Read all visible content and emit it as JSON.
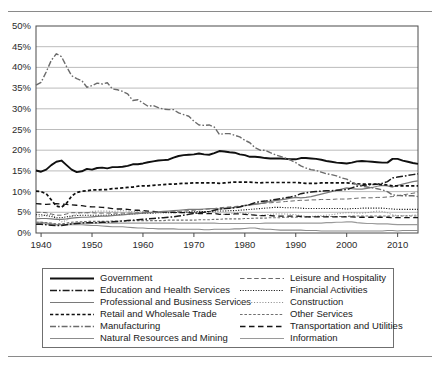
{
  "figure": {
    "top_rule": "horizontal-rule",
    "bottom_rule": "horizontal-rule"
  },
  "axes": {
    "y_ticks": [
      "0%",
      "5%",
      "10%",
      "15%",
      "20%",
      "25%",
      "30%",
      "35%",
      "40%",
      "45%",
      "50%"
    ],
    "x_ticks": [
      "1940",
      "1950",
      "1960",
      "1970",
      "1980",
      "1990",
      "2000",
      "2010"
    ]
  },
  "legend": {
    "left_column": [
      {
        "label": "Government",
        "style": "solid-thick-black"
      },
      {
        "label": "Education and Health Services",
        "style": "dash-dot-black"
      },
      {
        "label": "Professional and Business Services",
        "style": "solid-gray"
      },
      {
        "label": "Retail and Wholesale Trade",
        "style": "dashed-bold-black"
      },
      {
        "label": "Manufacturing",
        "style": "dash-dot-gray"
      },
      {
        "label": "Natural Resources and Mining",
        "style": "solid-midgray"
      }
    ],
    "right_column": [
      {
        "label": "Leisure and Hospitality",
        "style": "dashed-thin-gray"
      },
      {
        "label": "Financial Activities",
        "style": "dotted-fine-black"
      },
      {
        "label": "Construction",
        "style": "dotted-fine-gray"
      },
      {
        "label": "Other Services",
        "style": "dashed-small-gray"
      },
      {
        "label": "Transportation and Utilities",
        "style": "long-dash-black"
      },
      {
        "label": "Information",
        "style": "solid-lightgray"
      }
    ]
  },
  "colors": {
    "plot_border": "#4a4a4a",
    "gridline": "#b4b4b4",
    "government": "#101010",
    "education": "#1c1c1c",
    "professional": "#7a7a7a",
    "retail": "#0f0f0f",
    "manufacturing": "#6b6b6b",
    "natural_resources": "#8c8c8c",
    "leisure": "#6a6a6a",
    "financial": "#161616",
    "construction": "#8f8f8f",
    "other_services": "#707070",
    "transportation": "#141414",
    "information": "#9a9a9a"
  },
  "chart_data": {
    "type": "line",
    "title": "",
    "xlabel": "",
    "ylabel": "",
    "xlim": [
      1939,
      2014
    ],
    "ylim": [
      0,
      50
    ],
    "grid": true,
    "legend_position": "below-plot-two-columns",
    "x": [
      1939,
      1940,
      1941,
      1942,
      1943,
      1944,
      1945,
      1946,
      1947,
      1948,
      1949,
      1950,
      1951,
      1952,
      1953,
      1954,
      1955,
      1956,
      1957,
      1958,
      1959,
      1960,
      1961,
      1962,
      1963,
      1964,
      1965,
      1966,
      1967,
      1968,
      1969,
      1970,
      1971,
      1972,
      1973,
      1974,
      1975,
      1976,
      1977,
      1978,
      1979,
      1980,
      1981,
      1982,
      1983,
      1984,
      1985,
      1986,
      1987,
      1988,
      1989,
      1990,
      1991,
      1992,
      1993,
      1994,
      1995,
      1996,
      1997,
      1998,
      1999,
      2000,
      2001,
      2002,
      2003,
      2004,
      2005,
      2006,
      2007,
      2008,
      2009,
      2010,
      2011,
      2012,
      2013,
      2014
    ],
    "series": [
      {
        "name": "Manufacturing",
        "style": "dash-dot-gray",
        "values": [
          35.7,
          36.4,
          38.9,
          41.7,
          43.3,
          42.6,
          40.2,
          38.0,
          37.3,
          36.8,
          35.2,
          35.6,
          36.2,
          36.0,
          36.3,
          34.8,
          34.6,
          34.2,
          33.6,
          32.0,
          32.2,
          31.4,
          30.6,
          30.8,
          30.3,
          29.9,
          29.8,
          29.8,
          29.0,
          28.6,
          28.2,
          27.0,
          26.1,
          26.0,
          26.1,
          25.6,
          23.8,
          24.0,
          24.0,
          23.6,
          23.2,
          22.4,
          21.8,
          20.6,
          20.0,
          20.0,
          19.4,
          18.9,
          18.5,
          18.1,
          17.6,
          17.0,
          16.2,
          15.7,
          15.3,
          15.1,
          14.7,
          14.3,
          14.1,
          13.8,
          13.3,
          13.0,
          12.3,
          11.7,
          11.3,
          11.1,
          10.9,
          10.7,
          10.4,
          10.0,
          9.2,
          9.1,
          9.0,
          9.0,
          9.0,
          8.8
        ]
      },
      {
        "name": "Government",
        "style": "solid-thick-black",
        "values": [
          15.1,
          14.8,
          15.3,
          16.4,
          17.2,
          17.5,
          16.4,
          15.3,
          14.7,
          14.9,
          15.5,
          15.3,
          15.7,
          15.8,
          15.6,
          15.9,
          15.9,
          16.0,
          16.2,
          16.6,
          16.6,
          16.8,
          17.1,
          17.3,
          17.5,
          17.6,
          17.7,
          18.2,
          18.6,
          18.8,
          18.9,
          19.0,
          19.2,
          19.0,
          18.9,
          19.3,
          19.8,
          19.7,
          19.5,
          19.4,
          19.0,
          18.8,
          18.4,
          18.4,
          18.3,
          18.1,
          18.0,
          18.0,
          18.0,
          17.9,
          17.8,
          17.8,
          18.1,
          18.1,
          18.0,
          17.9,
          17.7,
          17.4,
          17.2,
          17.0,
          16.9,
          16.8,
          17.0,
          17.3,
          17.4,
          17.3,
          17.2,
          17.1,
          17.0,
          17.0,
          17.9,
          17.9,
          17.5,
          17.2,
          16.9,
          16.7
        ]
      },
      {
        "name": "Retail and Wholesale Trade",
        "style": "dashed-bold-black",
        "values": [
          10.1,
          10.0,
          9.5,
          8.0,
          6.5,
          6.2,
          7.2,
          8.9,
          9.8,
          10.1,
          10.2,
          10.4,
          10.4,
          10.5,
          10.5,
          10.7,
          10.8,
          10.9,
          11.0,
          11.1,
          11.3,
          11.4,
          11.4,
          11.5,
          11.6,
          11.7,
          11.8,
          11.8,
          11.9,
          12.0,
          12.0,
          12.1,
          12.1,
          12.1,
          12.1,
          12.1,
          12.0,
          12.1,
          12.2,
          12.3,
          12.3,
          12.3,
          12.3,
          12.2,
          12.1,
          12.2,
          12.2,
          12.2,
          12.2,
          12.2,
          12.2,
          12.2,
          12.1,
          12.0,
          12.0,
          12.0,
          12.1,
          12.1,
          12.1,
          12.1,
          12.1,
          12.1,
          12.0,
          11.9,
          11.8,
          11.8,
          11.8,
          11.8,
          11.7,
          11.6,
          11.4,
          11.4,
          11.4,
          11.4,
          11.4,
          11.4
        ]
      },
      {
        "name": "Education and Health Services",
        "style": "dash-dot-black",
        "values": [
          2.1,
          2.1,
          2.0,
          1.9,
          1.8,
          1.8,
          2.0,
          2.2,
          2.3,
          2.4,
          2.5,
          2.5,
          2.5,
          2.6,
          2.6,
          2.7,
          2.8,
          2.9,
          3.0,
          3.1,
          3.2,
          3.3,
          3.4,
          3.5,
          3.6,
          3.7,
          3.8,
          3.9,
          4.1,
          4.3,
          4.5,
          4.7,
          4.9,
          5.0,
          5.2,
          5.5,
          5.8,
          5.9,
          6.0,
          6.1,
          6.3,
          6.6,
          6.9,
          7.3,
          7.6,
          7.7,
          7.9,
          8.1,
          8.3,
          8.5,
          8.7,
          9.0,
          9.5,
          9.7,
          9.9,
          10.0,
          10.1,
          10.2,
          10.2,
          10.3,
          10.4,
          10.5,
          10.9,
          11.3,
          11.5,
          11.6,
          11.7,
          11.8,
          12.0,
          12.4,
          13.3,
          13.5,
          13.7,
          13.9,
          14.1,
          14.3
        ]
      },
      {
        "name": "Professional and Business Services",
        "style": "solid-gray",
        "values": [
          3.4,
          3.5,
          3.5,
          3.4,
          3.3,
          3.3,
          3.4,
          3.6,
          3.7,
          3.8,
          3.8,
          3.9,
          4.0,
          4.1,
          4.1,
          4.2,
          4.3,
          4.4,
          4.5,
          4.6,
          4.7,
          4.8,
          4.9,
          5.0,
          5.1,
          5.2,
          5.3,
          5.4,
          5.5,
          5.6,
          5.7,
          5.7,
          5.7,
          5.8,
          5.9,
          5.9,
          5.8,
          5.9,
          6.0,
          6.2,
          6.4,
          6.6,
          6.8,
          6.9,
          7.1,
          7.4,
          7.6,
          7.8,
          8.0,
          8.2,
          8.4,
          8.6,
          8.5,
          8.6,
          8.8,
          9.1,
          9.4,
          9.7,
          10.0,
          10.3,
          10.6,
          10.9,
          10.7,
          10.6,
          10.6,
          10.8,
          11.0,
          11.3,
          11.5,
          11.4,
          11.1,
          11.5,
          11.8,
          12.1,
          12.4,
          12.6
        ]
      },
      {
        "name": "Transportation and Utilities",
        "style": "long-dash-black",
        "values": [
          7.1,
          7.0,
          6.9,
          7.0,
          7.1,
          7.0,
          6.9,
          6.8,
          6.7,
          6.6,
          6.4,
          6.3,
          6.3,
          6.2,
          6.1,
          5.9,
          5.8,
          5.8,
          5.7,
          5.5,
          5.5,
          5.4,
          5.3,
          5.2,
          5.1,
          5.1,
          5.0,
          5.0,
          4.9,
          4.9,
          4.9,
          4.8,
          4.7,
          4.7,
          4.7,
          4.7,
          4.5,
          4.5,
          4.5,
          4.6,
          4.6,
          4.5,
          4.4,
          4.3,
          4.2,
          4.2,
          4.2,
          4.1,
          4.1,
          4.1,
          4.1,
          4.1,
          4.0,
          3.9,
          3.9,
          3.9,
          3.9,
          3.9,
          3.9,
          3.9,
          3.9,
          3.9,
          3.9,
          3.8,
          3.8,
          3.8,
          3.8,
          3.8,
          3.8,
          3.8,
          3.7,
          3.7,
          3.7,
          3.7,
          3.7,
          3.7
        ]
      },
      {
        "name": "Leisure and Hospitality",
        "style": "dashed-thin-gray",
        "values": [
          5.0,
          5.0,
          4.9,
          4.6,
          4.3,
          4.3,
          4.6,
          4.9,
          4.9,
          4.9,
          4.9,
          4.9,
          4.8,
          4.8,
          4.8,
          4.8,
          4.8,
          4.8,
          4.8,
          4.8,
          4.9,
          4.9,
          4.9,
          4.9,
          5.0,
          5.0,
          5.1,
          5.1,
          5.2,
          5.3,
          5.4,
          5.5,
          5.6,
          5.7,
          5.8,
          5.9,
          6.1,
          6.2,
          6.3,
          6.4,
          6.5,
          6.7,
          6.8,
          7.0,
          7.1,
          7.2,
          7.3,
          7.4,
          7.5,
          7.6,
          7.7,
          7.8,
          7.9,
          7.9,
          8.0,
          8.0,
          8.1,
          8.1,
          8.1,
          8.2,
          8.2,
          8.2,
          8.3,
          8.4,
          8.5,
          8.5,
          8.5,
          8.6,
          8.6,
          8.7,
          8.8,
          9.0,
          9.2,
          9.4,
          9.6,
          9.8
        ]
      },
      {
        "name": "Financial Activities",
        "style": "dotted-fine-black",
        "values": [
          4.4,
          4.4,
          4.2,
          4.0,
          3.7,
          3.7,
          3.9,
          4.1,
          4.2,
          4.3,
          4.3,
          4.3,
          4.3,
          4.3,
          4.3,
          4.4,
          4.4,
          4.5,
          4.5,
          4.6,
          4.7,
          4.7,
          4.8,
          4.8,
          4.9,
          4.9,
          4.9,
          4.9,
          5.0,
          5.0,
          5.1,
          5.1,
          5.2,
          5.2,
          5.2,
          5.3,
          5.3,
          5.3,
          5.4,
          5.4,
          5.5,
          5.6,
          5.7,
          5.8,
          5.9,
          6.0,
          6.1,
          6.2,
          6.2,
          6.1,
          6.1,
          6.1,
          6.0,
          5.9,
          5.9,
          5.9,
          5.9,
          5.9,
          5.9,
          5.9,
          5.9,
          5.8,
          5.9,
          5.9,
          6.0,
          6.0,
          6.0,
          6.0,
          6.0,
          5.9,
          5.8,
          5.7,
          5.7,
          5.7,
          5.7,
          5.7
        ]
      },
      {
        "name": "Construction",
        "style": "dotted-fine-gray",
        "values": [
          3.9,
          4.0,
          4.4,
          4.5,
          3.5,
          2.7,
          3.0,
          4.1,
          4.6,
          4.9,
          4.8,
          5.2,
          5.3,
          5.3,
          5.3,
          5.2,
          5.3,
          5.4,
          5.3,
          5.1,
          5.3,
          5.2,
          5.0,
          5.0,
          4.9,
          5.0,
          5.0,
          5.0,
          4.9,
          4.9,
          5.0,
          5.0,
          5.0,
          5.1,
          5.2,
          5.0,
          4.6,
          4.5,
          4.6,
          4.8,
          4.9,
          4.8,
          4.6,
          4.3,
          4.2,
          4.4,
          4.5,
          4.6,
          4.6,
          4.6,
          4.5,
          4.4,
          4.2,
          4.0,
          4.0,
          4.1,
          4.2,
          4.3,
          4.4,
          4.6,
          4.8,
          4.9,
          4.9,
          4.8,
          4.8,
          4.9,
          5.1,
          5.3,
          5.2,
          4.9,
          4.4,
          4.2,
          4.2,
          4.2,
          4.3,
          4.4
        ]
      },
      {
        "name": "Other Services",
        "style": "dashed-small-gray",
        "values": [
          2.6,
          2.6,
          2.5,
          2.4,
          2.2,
          2.2,
          2.4,
          2.6,
          2.7,
          2.7,
          2.8,
          2.8,
          2.8,
          2.8,
          2.8,
          2.9,
          2.9,
          2.9,
          2.9,
          3.0,
          3.0,
          3.0,
          3.0,
          3.0,
          3.0,
          3.0,
          3.1,
          3.1,
          3.1,
          3.1,
          3.1,
          3.1,
          3.2,
          3.2,
          3.2,
          3.3,
          3.3,
          3.4,
          3.4,
          3.4,
          3.4,
          3.5,
          3.5,
          3.6,
          3.6,
          3.6,
          3.7,
          3.7,
          3.7,
          3.8,
          3.8,
          3.8,
          3.9,
          3.9,
          3.9,
          4.0,
          4.0,
          4.0,
          4.0,
          4.0,
          4.0,
          4.0,
          4.1,
          4.1,
          4.1,
          4.1,
          4.1,
          4.1,
          4.1,
          4.1,
          4.1,
          4.1,
          4.1,
          4.1,
          4.1,
          4.1
        ]
      },
      {
        "name": "Information",
        "style": "solid-lightgray",
        "values": [
          2.3,
          2.3,
          2.2,
          2.1,
          2.0,
          2.0,
          2.1,
          2.3,
          2.4,
          2.4,
          2.4,
          2.4,
          2.4,
          2.4,
          2.4,
          2.4,
          2.4,
          2.4,
          2.4,
          2.4,
          2.4,
          2.4,
          2.4,
          2.4,
          2.4,
          2.4,
          2.4,
          2.4,
          2.4,
          2.4,
          2.4,
          2.4,
          2.4,
          2.4,
          2.4,
          2.4,
          2.3,
          2.3,
          2.3,
          2.3,
          2.3,
          2.3,
          2.3,
          2.3,
          2.3,
          2.4,
          2.4,
          2.4,
          2.4,
          2.4,
          2.4,
          2.4,
          2.4,
          2.4,
          2.4,
          2.4,
          2.4,
          2.5,
          2.5,
          2.6,
          2.6,
          2.7,
          2.7,
          2.5,
          2.4,
          2.3,
          2.3,
          2.2,
          2.2,
          2.2,
          2.1,
          2.0,
          2.0,
          2.0,
          2.0,
          2.0
        ]
      },
      {
        "name": "Natural Resources and Mining",
        "style": "solid-midgray",
        "values": [
          2.6,
          2.6,
          2.4,
          2.2,
          2.0,
          2.0,
          2.0,
          2.0,
          2.0,
          2.0,
          1.9,
          1.8,
          1.8,
          1.7,
          1.6,
          1.5,
          1.5,
          1.5,
          1.4,
          1.3,
          1.2,
          1.2,
          1.1,
          1.1,
          1.0,
          1.0,
          1.0,
          1.0,
          0.9,
          0.9,
          0.9,
          0.9,
          0.9,
          0.8,
          0.8,
          0.9,
          0.9,
          0.9,
          0.9,
          1.0,
          1.0,
          1.1,
          1.2,
          1.2,
          1.0,
          0.9,
          0.9,
          0.8,
          0.7,
          0.7,
          0.7,
          0.7,
          0.7,
          0.6,
          0.6,
          0.6,
          0.5,
          0.5,
          0.5,
          0.5,
          0.5,
          0.5,
          0.5,
          0.5,
          0.5,
          0.5,
          0.5,
          0.5,
          0.5,
          0.6,
          0.6,
          0.5,
          0.6,
          0.6,
          0.6,
          0.6
        ]
      }
    ]
  }
}
